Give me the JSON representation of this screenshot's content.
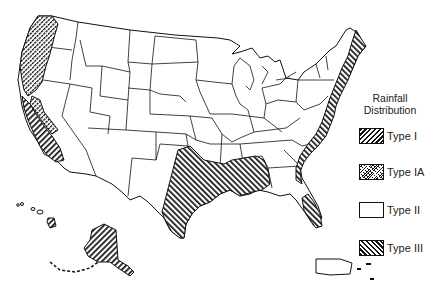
{
  "legend": {
    "title_line1": "Rainfall",
    "title_line2": "Distribution",
    "items": [
      {
        "label": "Type I",
        "pattern": "diagonal-hatch-forward"
      },
      {
        "label": "Type IA",
        "pattern": "dense-cross-hatch"
      },
      {
        "label": "Type II",
        "pattern": "none"
      },
      {
        "label": "Type III",
        "pattern": "diagonal-hatch-backward"
      }
    ]
  },
  "map": {
    "regions": [
      {
        "name": "Pacific Northwest coast",
        "type": "Type IA"
      },
      {
        "name": "California coast",
        "type": "Type I"
      },
      {
        "name": "Alaska",
        "type": "Type I"
      },
      {
        "name": "Hawaii",
        "type": "Type I"
      },
      {
        "name": "Gulf Coast",
        "type": "Type III"
      },
      {
        "name": "Atlantic Coast",
        "type": "Type III"
      },
      {
        "name": "Interior US",
        "type": "Type II"
      },
      {
        "name": "Puerto Rico",
        "type": "Type II"
      }
    ],
    "colors": {
      "line": "#111111",
      "background": "#ffffff"
    }
  }
}
